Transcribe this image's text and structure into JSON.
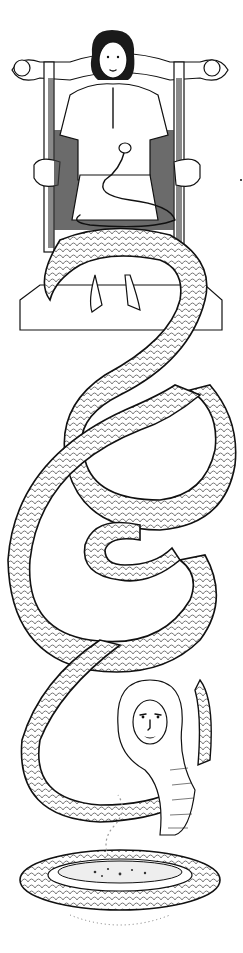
{
  "illustration": {
    "description": "Black-and-white ink drawing: a curly-haired youth seated on a carved wooden chair with a small snake in his lap; a giant scaled serpent coils down from the chair and ends in a cobra hood with a woman's face, its coils encircling a bowl with rising smoke",
    "palette": {
      "ink": "#111111",
      "paper": "#ffffff",
      "shade": "#3a3a3a"
    },
    "figures": [
      "seated-youth",
      "carved-chair",
      "small-snake",
      "giant-serpent",
      "cobra-woman-head",
      "smoking-bowl"
    ]
  }
}
